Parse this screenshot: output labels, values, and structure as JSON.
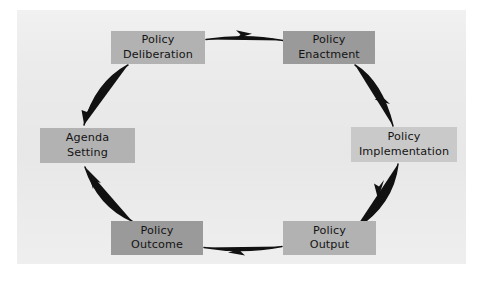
{
  "diagram": {
    "panel_color": "#ebebeb",
    "page_background": "#ffffff",
    "arrow_color": "#111111",
    "text_color": "#141414",
    "nodes": [
      {
        "id": "policy-deliberation",
        "line1": "Policy",
        "line2": "Deliberation",
        "fill": "#b2b2b2",
        "x": 111,
        "y": 31,
        "w": 94,
        "h": 33
      },
      {
        "id": "policy-enactment",
        "line1": "Policy",
        "line2": "Enactment",
        "fill": "#9a9a9a",
        "x": 283,
        "y": 31,
        "w": 92,
        "h": 33
      },
      {
        "id": "policy-implementation",
        "line1": "Policy",
        "line2": "Implementation",
        "fill": "#c9c9c9",
        "x": 351,
        "y": 127,
        "w": 106,
        "h": 35
      },
      {
        "id": "policy-output",
        "line1": "Policy",
        "line2": "Output",
        "fill": "#b2b2b2",
        "x": 283,
        "y": 221,
        "w": 93,
        "h": 34
      },
      {
        "id": "policy-outcome",
        "line1": "Policy",
        "line2": "Outcome",
        "fill": "#9a9a9a",
        "x": 111,
        "y": 221,
        "w": 92,
        "h": 34
      },
      {
        "id": "agenda-setting",
        "line1": "Agenda",
        "line2": "Setting",
        "fill": "#b2b2b2",
        "x": 40,
        "y": 128,
        "w": 95,
        "h": 35
      }
    ],
    "connections": [
      {
        "id": "deliberation-to-enactment",
        "from": "policy-deliberation",
        "to": "policy-enactment",
        "direction": "right"
      },
      {
        "id": "enactment-to-implementation",
        "from": "policy-enactment",
        "to": "policy-implementation",
        "direction": "down-right"
      },
      {
        "id": "implementation-to-output",
        "from": "policy-implementation",
        "to": "policy-output",
        "direction": "down-left"
      },
      {
        "id": "output-to-outcome",
        "from": "policy-output",
        "to": "policy-outcome",
        "direction": "left"
      },
      {
        "id": "outcome-to-agenda-setting",
        "from": "policy-outcome",
        "to": "agenda-setting",
        "direction": "up-left"
      },
      {
        "id": "agenda-setting-to-deliberation",
        "from": "agenda-setting",
        "to": "policy-deliberation",
        "direction": "up-right-reversed"
      }
    ]
  }
}
